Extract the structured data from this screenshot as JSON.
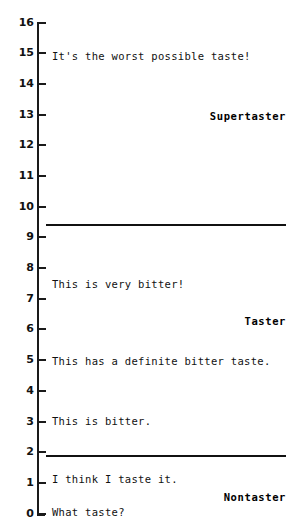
{
  "chart_data": {
    "type": "scatter",
    "title": "",
    "xlabel": "",
    "ylabel": "",
    "ylim": [
      0,
      16
    ],
    "grid": false,
    "legend_position": "none",
    "orientation": "vertical-scale",
    "y_ticks": [
      16,
      15,
      14,
      13,
      12,
      11,
      10,
      9,
      8,
      7,
      6,
      5,
      4,
      3,
      2,
      1,
      0
    ],
    "y_tick_labels": [
      "16",
      "15",
      "14",
      "13",
      "12",
      "11",
      "10",
      "9",
      "8",
      "7",
      "6",
      "5",
      "4",
      "3",
      "2",
      "1",
      "0"
    ],
    "annotations": [
      {
        "text": "It's the worst possible taste!",
        "y": 15.0,
        "align": "left"
      },
      {
        "text": "This is very bitter!",
        "y": 7.4,
        "align": "left"
      },
      {
        "text": "This has a definite bitter taste.",
        "y": 5.0,
        "align": "left"
      },
      {
        "text": "This is bitter.",
        "y": 3.0,
        "align": "left"
      },
      {
        "text": "I think I taste it.",
        "y": 1.1,
        "align": "left"
      },
      {
        "text": "What taste?",
        "y": 0.0,
        "align": "left"
      }
    ],
    "category_labels": [
      {
        "text": "Supertaster",
        "y": 13.0,
        "align": "right"
      },
      {
        "text": "Taster",
        "y": 6.2,
        "align": "right"
      },
      {
        "text": "Nontaster",
        "y": 0.55,
        "align": "right"
      }
    ],
    "reference_lines": [
      {
        "y": 9.3,
        "label": "supertaster-taster-boundary"
      },
      {
        "y": 1.75,
        "label": "taster-nontaster-boundary"
      }
    ],
    "colors": {
      "axis": "#1a1a1a",
      "text": "#111111",
      "rule": "#111111",
      "background": "#ffffff"
    }
  },
  "axis": {
    "ticks": [
      {
        "label": "16",
        "top": 22
      },
      {
        "label": "15",
        "top": 52
      },
      {
        "label": "14",
        "top": 83
      },
      {
        "label": "13",
        "top": 114
      },
      {
        "label": "12",
        "top": 144
      },
      {
        "label": "11",
        "top": 175
      },
      {
        "label": "10",
        "top": 206
      },
      {
        "label": "9",
        "top": 236
      },
      {
        "label": "8",
        "top": 267
      },
      {
        "label": "7",
        "top": 298
      },
      {
        "label": "6",
        "top": 328
      },
      {
        "label": "5",
        "top": 359
      },
      {
        "label": "4",
        "top": 390
      },
      {
        "label": "3",
        "top": 421
      },
      {
        "label": "2",
        "top": 451
      },
      {
        "label": "1",
        "top": 482
      },
      {
        "label": "0",
        "top": 513
      }
    ]
  },
  "rules": [
    {
      "name": "supertaster-taster-divider",
      "top": 224
    },
    {
      "name": "taster-nontaster-divider",
      "top": 455
    }
  ],
  "descriptors": [
    {
      "name": "descriptor-worst-possible-taste",
      "text": "It's the worst possible taste!",
      "top": 50
    },
    {
      "name": "descriptor-very-bitter",
      "text": "This is very bitter!",
      "top": 278
    },
    {
      "name": "descriptor-definite-bitter",
      "text": "This has a definite bitter taste.",
      "top": 355
    },
    {
      "name": "descriptor-bitter",
      "text": "This is bitter.",
      "top": 415
    },
    {
      "name": "descriptor-think-i-taste-it",
      "text": "I think I taste it.",
      "top": 473
    },
    {
      "name": "descriptor-what-taste",
      "text": "What taste?",
      "top": 506
    }
  ],
  "groups": [
    {
      "name": "group-label-supertaster",
      "text": "Supertaster",
      "top": 110
    },
    {
      "name": "group-label-taster",
      "text": "Taster",
      "top": 315
    },
    {
      "name": "group-label-nontaster",
      "text": "Nontaster",
      "top": 491
    }
  ]
}
